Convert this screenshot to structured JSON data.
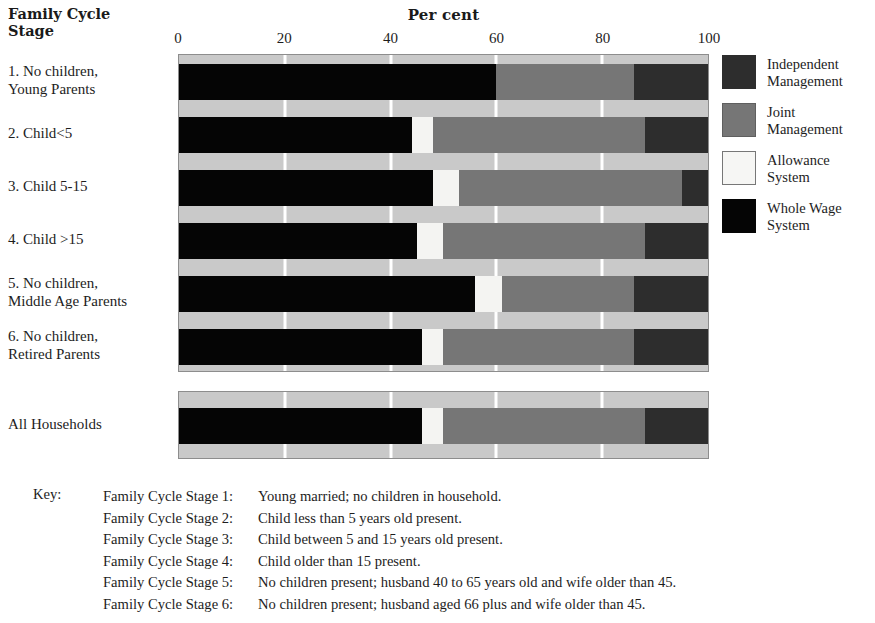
{
  "header": {
    "stage_header": "Family Cycle\nStage",
    "axis_title": "Per cent"
  },
  "axis": {
    "ticks": [
      "0",
      "20",
      "40",
      "60",
      "80",
      "100"
    ],
    "tick_values": [
      0,
      20,
      40,
      60,
      80,
      100
    ],
    "min": 0,
    "max": 100
  },
  "legend": {
    "items": [
      {
        "label": "Independent\nManagement",
        "key": "independent",
        "color": "#2d2d2d"
      },
      {
        "label": "Joint\nManagement",
        "key": "joint",
        "color": "#767676"
      },
      {
        "label": "Allowance\nSystem",
        "key": "allowance",
        "color": "#f4f4f2"
      },
      {
        "label": "Whole Wage\nSystem",
        "key": "wholewage",
        "color": "#050505"
      }
    ]
  },
  "key": {
    "label": "Key:",
    "rows": [
      {
        "stage": "Family Cycle Stage 1:",
        "desc": "Young married; no children in household."
      },
      {
        "stage": "Family Cycle Stage 2:",
        "desc": "Child less than 5 years old present."
      },
      {
        "stage": "Family Cycle Stage 3:",
        "desc": "Child between 5 and 15 years old present."
      },
      {
        "stage": "Family Cycle Stage 4:",
        "desc": "Child older than 15 present."
      },
      {
        "stage": "Family Cycle Stage 5:",
        "desc": "No children present; husband 40 to 65 years old and wife older than 45."
      },
      {
        "stage": "Family Cycle Stage 6:",
        "desc": "No children present; husband aged 66 plus and wife older than 45."
      }
    ]
  },
  "chart_data": {
    "type": "bar",
    "orientation": "horizontal",
    "stacked": true,
    "title": "Per cent",
    "xlabel": "Per cent",
    "ylabel": "Family Cycle Stage",
    "xlim": [
      0,
      100
    ],
    "xticks": [
      0,
      20,
      40,
      60,
      80,
      100
    ],
    "grid": true,
    "legend_position": "right",
    "categories": [
      "1. No children,\nYoung Parents",
      "2. Child<5",
      "3. Child 5-15",
      "4. Child >15",
      "5. No children,\nMiddle Age Parents",
      "6. No children,\nRetired Parents"
    ],
    "total_category": "All Households",
    "series": [
      {
        "name": "Whole Wage System",
        "color": "#050505",
        "values": [
          60,
          44,
          48,
          45,
          56,
          46
        ],
        "total_value": 46
      },
      {
        "name": "Allowance System",
        "color": "#f4f4f2",
        "values": [
          0,
          4,
          5,
          5,
          5,
          4
        ],
        "total_value": 4
      },
      {
        "name": "Joint Management",
        "color": "#767676",
        "values": [
          26,
          40,
          42,
          38,
          25,
          36
        ],
        "total_value": 38
      },
      {
        "name": "Independent Management",
        "color": "#2d2d2d",
        "values": [
          14,
          12,
          5,
          12,
          14,
          14
        ],
        "total_value": 12
      }
    ],
    "bars": [
      {
        "category": "1. No children,\nYoung Parents",
        "segments": [
          {
            "name": "Whole Wage System",
            "key": "wholewage",
            "value": 60
          },
          {
            "name": "Allowance System",
            "key": "allowance",
            "value": 0
          },
          {
            "name": "Joint Management",
            "key": "joint",
            "value": 26
          },
          {
            "name": "Independent Management",
            "key": "independent",
            "value": 14
          }
        ]
      },
      {
        "category": "2. Child<5",
        "segments": [
          {
            "name": "Whole Wage System",
            "key": "wholewage",
            "value": 44
          },
          {
            "name": "Allowance System",
            "key": "allowance",
            "value": 4
          },
          {
            "name": "Joint Management",
            "key": "joint",
            "value": 40
          },
          {
            "name": "Independent Management",
            "key": "independent",
            "value": 12
          }
        ]
      },
      {
        "category": "3. Child 5-15",
        "segments": [
          {
            "name": "Whole Wage System",
            "key": "wholewage",
            "value": 48
          },
          {
            "name": "Allowance System",
            "key": "allowance",
            "value": 5
          },
          {
            "name": "Joint Management",
            "key": "joint",
            "value": 42
          },
          {
            "name": "Independent Management",
            "key": "independent",
            "value": 5
          }
        ]
      },
      {
        "category": "4. Child >15",
        "segments": [
          {
            "name": "Whole Wage System",
            "key": "wholewage",
            "value": 45
          },
          {
            "name": "Allowance System",
            "key": "allowance",
            "value": 5
          },
          {
            "name": "Joint Management",
            "key": "joint",
            "value": 38
          },
          {
            "name": "Independent Management",
            "key": "independent",
            "value": 12
          }
        ]
      },
      {
        "category": "5. No children,\nMiddle Age Parents",
        "segments": [
          {
            "name": "Whole Wage System",
            "key": "wholewage",
            "value": 56
          },
          {
            "name": "Allowance System",
            "key": "allowance",
            "value": 5
          },
          {
            "name": "Joint Management",
            "key": "joint",
            "value": 25
          },
          {
            "name": "Independent Management",
            "key": "independent",
            "value": 14
          }
        ]
      },
      {
        "category": "6. No children,\nRetired Parents",
        "segments": [
          {
            "name": "Whole Wage System",
            "key": "wholewage",
            "value": 46
          },
          {
            "name": "Allowance System",
            "key": "allowance",
            "value": 4
          },
          {
            "name": "Joint Management",
            "key": "joint",
            "value": 36
          },
          {
            "name": "Independent Management",
            "key": "independent",
            "value": 14
          }
        ]
      }
    ],
    "total_bar": {
      "category": "All Households",
      "segments": [
        {
          "name": "Whole Wage System",
          "key": "wholewage",
          "value": 46
        },
        {
          "name": "Allowance System",
          "key": "allowance",
          "value": 4
        },
        {
          "name": "Joint Management",
          "key": "joint",
          "value": 38
        },
        {
          "name": "Independent Management",
          "key": "independent",
          "value": 12
        }
      ]
    }
  }
}
